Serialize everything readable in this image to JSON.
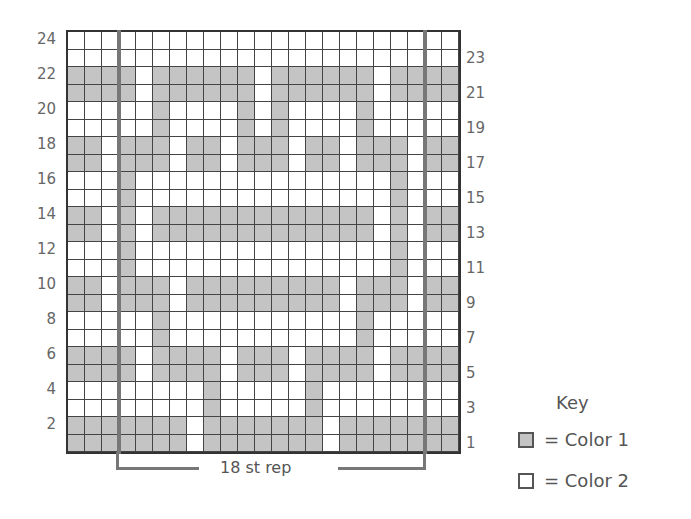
{
  "chart_data": {
    "type": "table",
    "columns": 23,
    "rows": 24,
    "repeat": {
      "label": "18 st rep",
      "start_col": 4,
      "end_col": 21
    },
    "left_row_labels": [
      "24",
      "22",
      "20",
      "18",
      "16",
      "14",
      "12",
      "10",
      "8",
      "6",
      "4",
      "2"
    ],
    "right_row_labels": [
      "23",
      "21",
      "19",
      "17",
      "15",
      "13",
      "11",
      "9",
      "7",
      "5",
      "3",
      "1"
    ],
    "legend": [
      {
        "symbol": "grey-square",
        "label": "= Color 1",
        "color": "#c4c4c4"
      },
      {
        "symbol": "white-square",
        "label": "= Color 2",
        "color": "#ffffff"
      }
    ],
    "grid_rows_top_to_bottom": [
      "00000000000000000000000",
      "00000000000000000000000",
      "11110111111011111101111",
      "11110111111011111101111",
      "00000100001010000100000",
      "00000100001010000100000",
      "11011101101110110111011",
      "11011101101110110111011",
      "00010000000000000001000",
      "00010000000000000001000",
      "11010111111111111101011",
      "11010111111111111101011",
      "00010000000000000001000",
      "00010000000000000001000",
      "11011101111111110111011",
      "11011101111111110111011",
      "00000100000000000100000",
      "00000100000000000100000",
      "11110111101110111101111",
      "11110111101110111101111",
      "00000000100000100000000",
      "00000000100000100000000",
      "11111110111111101111111",
      "11111110111111101111111"
    ]
  },
  "rep_label": "18 st rep",
  "key": {
    "title": "Key",
    "items": [
      {
        "label": "= Color 1"
      },
      {
        "label": "= Color 2"
      }
    ]
  }
}
